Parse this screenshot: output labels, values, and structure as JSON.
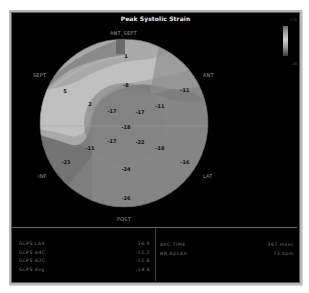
{
  "window": {
    "title": "Peak Systolic Strain"
  },
  "color_scale": {
    "max_label": "+20",
    "min_label": "-20"
  },
  "bullseye": {
    "orientation_labels": {
      "top": "ANT_SEPT",
      "upper_left": "SEPT",
      "upper_right": "ANT",
      "lower_left": "INF",
      "lower_right": "LAT",
      "bottom": "POST"
    },
    "segment_values": [
      {
        "id": "basal-ant-sept",
        "value": "1"
      },
      {
        "id": "basal-sept",
        "value": "5"
      },
      {
        "id": "mid-ant-sept",
        "value": "-8"
      },
      {
        "id": "mid-sept",
        "value": "2"
      },
      {
        "id": "basal-ant",
        "value": "-11"
      },
      {
        "id": "mid-ant",
        "value": "-11"
      },
      {
        "id": "apical-sept",
        "value": "-17"
      },
      {
        "id": "apical-ant",
        "value": "-17"
      },
      {
        "id": "apex",
        "value": "-18"
      },
      {
        "id": "apical-inf",
        "value": "-17"
      },
      {
        "id": "apical-lat",
        "value": "-22"
      },
      {
        "id": "mid-inf",
        "value": "-11"
      },
      {
        "id": "mid-lat",
        "value": "-18"
      },
      {
        "id": "basal-inf",
        "value": "-23"
      },
      {
        "id": "basal-lat",
        "value": "-16"
      },
      {
        "id": "mid-post",
        "value": "-24"
      },
      {
        "id": "basal-post",
        "value": "-26"
      }
    ]
  },
  "stats": {
    "left": [
      {
        "label": "GLPS LAX",
        "value": "-16.9"
      },
      {
        "label": "GLPS A4C",
        "value": "-11.2"
      },
      {
        "label": "GLPS A2C",
        "value": "-11.6"
      },
      {
        "label": "GLPS Avg",
        "value": "-14.4"
      }
    ],
    "right": [
      {
        "label": "AVC TIME",
        "value": "367 msec"
      },
      {
        "label": "HR ApLAX",
        "value": "73 bpm"
      }
    ]
  }
}
